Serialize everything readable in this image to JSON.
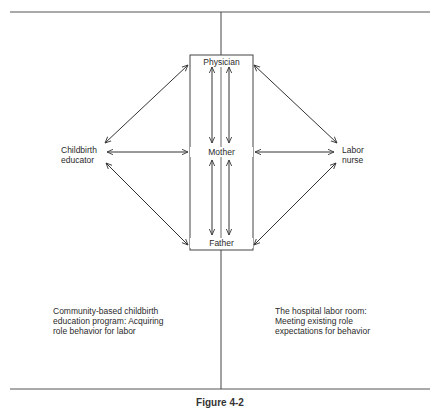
{
  "nodes": {
    "physician": "Physician",
    "mother": "Mother",
    "father": "Father",
    "childbirth_educator": [
      "Childbirth",
      "educator"
    ],
    "labor_nurse": [
      "Labor",
      "nurse"
    ]
  },
  "regions": {
    "left": [
      "Community-based childbirth",
      "education program:  Acquiring",
      "role behavior for labor"
    ],
    "right": [
      "The hospital labor room:",
      "Meeting existing role",
      "expectations for behavior"
    ]
  },
  "caption": "Figure 4-2",
  "colors": {
    "line": "#3a3a3a",
    "text": "#2a2a2a",
    "background": "#ffffff"
  }
}
